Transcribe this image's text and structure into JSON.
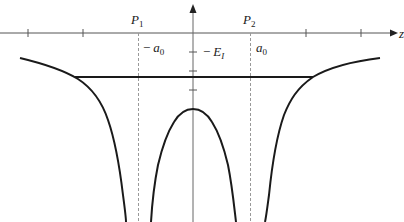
{
  "diagram": {
    "type": "potential-energy-diagram",
    "axes": {
      "x_axis_label_clipped": "z",
      "x_axis_arrow": "right",
      "y_axis_arrow": "up"
    },
    "labels": {
      "p1": {
        "letter": "P",
        "sub": "1"
      },
      "p2": {
        "letter": "P",
        "sub": "2"
      },
      "neg_a0": {
        "minus": "−",
        "letter": "a",
        "sub": "0"
      },
      "a0": {
        "letter": "a",
        "sub": "0"
      },
      "neg_ei": {
        "minus": "−",
        "letter": "E",
        "sub": "I"
      }
    },
    "elements": [
      "x-axis with tick marks",
      "y-axis with tick marks",
      "dashed vertical line at P1 (−a0)",
      "dashed vertical line at P2 (a0)",
      "horizontal energy level line",
      "left potential well curve",
      "central potential barrier curve",
      "right potential well curve"
    ],
    "colors": {
      "curve": "#1a1a1a",
      "axis": "#555555",
      "dashed": "#888888",
      "background": "#ffffff"
    }
  }
}
